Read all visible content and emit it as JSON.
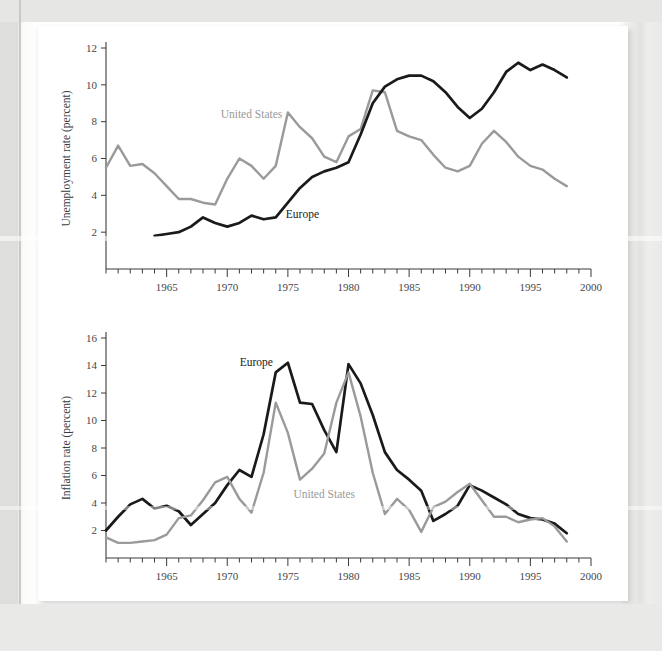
{
  "page": {
    "background_color": "#e9e9e7",
    "paper_color": "#ffffff"
  },
  "colors": {
    "europe": "#1a1a1a",
    "united_states": "#9a9a9a",
    "axis": "#3b3b3b",
    "text": "#46464a"
  },
  "chart_data": [
    {
      "type": "line",
      "id": "unemployment",
      "title": "",
      "xlabel": "",
      "ylabel": "Unemployment rate (percent)",
      "xlim": [
        1960,
        2000
      ],
      "ylim": [
        0,
        12
      ],
      "yticks": [
        2,
        4,
        6,
        8,
        10,
        12
      ],
      "ytick_labels": [
        "2",
        "4",
        "6",
        "8",
        "10",
        "12"
      ],
      "xticks_major": [
        1965,
        1970,
        1975,
        1980,
        1985,
        1990,
        1995,
        2000
      ],
      "xtick_labels": [
        "1965",
        "1970",
        "1975",
        "1980",
        "1985",
        "1990",
        "1995",
        "2000"
      ],
      "xticks_minor_step": 1,
      "grid": false,
      "legend": "inline-labels",
      "annotations": [
        {
          "text": "United States",
          "x": 1972.0,
          "y": 8.2,
          "color": "#9a9a9a"
        },
        {
          "text": "Europe",
          "x": 1976.2,
          "y": 2.75,
          "color": "#1a1a1a"
        }
      ],
      "series": [
        {
          "name": "United States",
          "color": "#9a9a9a",
          "x": [
            1960,
            1961,
            1962,
            1963,
            1964,
            1965,
            1966,
            1967,
            1968,
            1969,
            1970,
            1971,
            1972,
            1973,
            1974,
            1975,
            1976,
            1977,
            1978,
            1979,
            1980,
            1981,
            1982,
            1983,
            1984,
            1985,
            1986,
            1987,
            1988,
            1989,
            1990,
            1991,
            1992,
            1993,
            1994,
            1995,
            1996,
            1997,
            1998
          ],
          "values": [
            5.5,
            6.7,
            5.6,
            5.7,
            5.2,
            4.5,
            3.8,
            3.8,
            3.6,
            3.5,
            4.9,
            6.0,
            5.6,
            4.9,
            5.6,
            8.5,
            7.7,
            7.1,
            6.1,
            5.8,
            7.2,
            7.6,
            9.7,
            9.6,
            7.5,
            7.2,
            7.0,
            6.2,
            5.5,
            5.3,
            5.6,
            6.8,
            7.5,
            6.9,
            6.1,
            5.6,
            5.4,
            4.9,
            4.5
          ]
        },
        {
          "name": "Europe",
          "color": "#1a1a1a",
          "x": [
            1964,
            1965,
            1966,
            1967,
            1968,
            1969,
            1970,
            1971,
            1972,
            1973,
            1974,
            1975,
            1976,
            1977,
            1978,
            1979,
            1980,
            1981,
            1982,
            1983,
            1984,
            1985,
            1986,
            1987,
            1988,
            1989,
            1990,
            1991,
            1992,
            1993,
            1994,
            1995,
            1996,
            1997,
            1998
          ],
          "values": [
            1.8,
            1.9,
            2.0,
            2.3,
            2.8,
            2.5,
            2.3,
            2.5,
            2.9,
            2.7,
            2.8,
            3.6,
            4.4,
            5.0,
            5.3,
            5.5,
            5.8,
            7.3,
            9.0,
            9.9,
            10.3,
            10.5,
            10.5,
            10.2,
            9.6,
            8.8,
            8.2,
            8.7,
            9.6,
            10.7,
            11.2,
            10.8,
            11.1,
            10.8,
            10.4
          ]
        }
      ]
    },
    {
      "type": "line",
      "id": "inflation",
      "title": "",
      "xlabel": "",
      "ylabel": "Inflation rate (percent)",
      "xlim": [
        1960,
        2000
      ],
      "ylim": [
        0,
        16
      ],
      "yticks": [
        2,
        4,
        6,
        8,
        10,
        12,
        14,
        16
      ],
      "ytick_labels": [
        "2",
        "4",
        "6",
        "8",
        "10",
        "12",
        "14",
        "16"
      ],
      "xticks_major": [
        1965,
        1970,
        1975,
        1980,
        1985,
        1990,
        1995,
        2000
      ],
      "xtick_labels": [
        "1965",
        "1970",
        "1975",
        "1980",
        "1985",
        "1990",
        "1995",
        "2000"
      ],
      "xticks_minor_step": 1,
      "grid": false,
      "legend": "inline-labels",
      "annotations": [
        {
          "text": "Europe",
          "x": 1972.4,
          "y": 14.0,
          "color": "#1a1a1a"
        },
        {
          "text": "United States",
          "x": 1978.0,
          "y": 4.4,
          "color": "#9a9a9a"
        }
      ],
      "series": [
        {
          "name": "Europe",
          "color": "#1a1a1a",
          "x": [
            1960,
            1961,
            1962,
            1963,
            1964,
            1965,
            1966,
            1967,
            1968,
            1969,
            1970,
            1971,
            1972,
            1973,
            1974,
            1975,
            1976,
            1977,
            1978,
            1979,
            1980,
            1981,
            1982,
            1983,
            1984,
            1985,
            1986,
            1987,
            1988,
            1989,
            1990,
            1991,
            1992,
            1993,
            1994,
            1995,
            1996,
            1997,
            1998
          ],
          "values": [
            2.0,
            3.0,
            3.9,
            4.3,
            3.6,
            3.8,
            3.4,
            2.4,
            3.2,
            4.0,
            5.3,
            6.4,
            5.9,
            9.0,
            13.5,
            14.2,
            11.3,
            11.2,
            9.3,
            7.7,
            14.1,
            12.7,
            10.4,
            7.7,
            6.4,
            5.7,
            4.9,
            2.7,
            3.2,
            3.8,
            5.3,
            4.9,
            4.4,
            3.9,
            3.2,
            2.9,
            2.8,
            2.5,
            1.8
          ]
        },
        {
          "name": "United States",
          "color": "#9a9a9a",
          "x": [
            1960,
            1961,
            1962,
            1963,
            1964,
            1965,
            1966,
            1967,
            1968,
            1969,
            1970,
            1971,
            1972,
            1973,
            1974,
            1975,
            1976,
            1977,
            1978,
            1979,
            1980,
            1981,
            1982,
            1983,
            1984,
            1985,
            1986,
            1987,
            1988,
            1989,
            1990,
            1991,
            1992,
            1993,
            1994,
            1995,
            1996,
            1997,
            1998
          ],
          "values": [
            1.5,
            1.1,
            1.1,
            1.2,
            1.3,
            1.7,
            2.9,
            3.1,
            4.2,
            5.5,
            5.9,
            4.3,
            3.3,
            6.2,
            11.3,
            9.1,
            5.7,
            6.5,
            7.6,
            11.3,
            13.5,
            10.3,
            6.2,
            3.2,
            4.3,
            3.5,
            1.9,
            3.7,
            4.1,
            4.8,
            5.4,
            4.2,
            3.0,
            3.0,
            2.6,
            2.8,
            2.9,
            2.3,
            1.2
          ]
        }
      ]
    }
  ]
}
